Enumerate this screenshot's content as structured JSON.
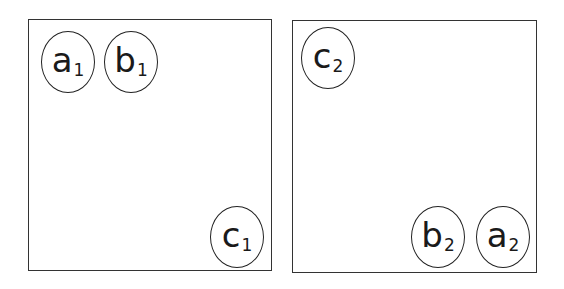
{
  "panels": [
    {
      "id": "left",
      "box": {
        "x": 28,
        "y": 19,
        "w": 244,
        "h": 252
      },
      "nodes": [
        {
          "letter": "a",
          "sub": "1",
          "cx": 68,
          "cy": 62,
          "rx": 27,
          "ry": 31
        },
        {
          "letter": "b",
          "sub": "1",
          "cx": 131,
          "cy": 62,
          "rx": 27,
          "ry": 31
        },
        {
          "letter": "c",
          "sub": "1",
          "cx": 237,
          "cy": 237,
          "rx": 27,
          "ry": 31
        }
      ]
    },
    {
      "id": "right",
      "box": {
        "x": 292,
        "y": 20,
        "w": 245,
        "h": 253
      },
      "nodes": [
        {
          "letter": "c",
          "sub": "2",
          "cx": 328,
          "cy": 58,
          "rx": 27,
          "ry": 31
        },
        {
          "letter": "b",
          "sub": "2",
          "cx": 438,
          "cy": 237,
          "rx": 27,
          "ry": 31
        },
        {
          "letter": "a",
          "sub": "2",
          "cx": 503,
          "cy": 237,
          "rx": 27,
          "ry": 31
        }
      ]
    }
  ]
}
